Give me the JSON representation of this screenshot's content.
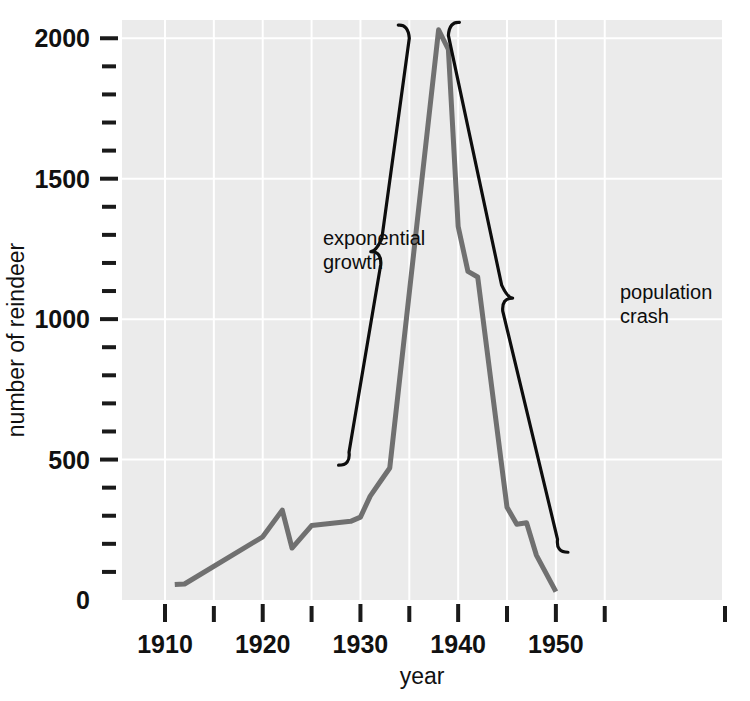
{
  "chart_data": {
    "type": "line",
    "title": "",
    "xlabel": "year",
    "ylabel": "number of reindeer",
    "xlim": [
      1905.6,
      1967.0
    ],
    "ylim": [
      0,
      2065
    ],
    "grid": true,
    "legend": "none",
    "x_ticks_major": [
      1910,
      1920,
      1930,
      1940,
      1950
    ],
    "x_ticks_major_labels": [
      "1910",
      "1920",
      "1930",
      "1940",
      "1950"
    ],
    "x_ticks_minor": [
      1905,
      1915,
      1925,
      1935,
      1945,
      1955
    ],
    "y_ticks_major": [
      0,
      500,
      1000,
      1500,
      2000
    ],
    "y_ticks_major_labels": [
      "0",
      "500",
      "1000",
      "1500",
      "2000"
    ],
    "y_ticks_minor": [
      100,
      200,
      300,
      400,
      600,
      700,
      800,
      900,
      1100,
      1200,
      1300,
      1400,
      1600,
      1700,
      1800,
      1900
    ],
    "series": [
      {
        "name": "reindeer population",
        "color": "#707070",
        "line_width": 5,
        "x": [
          1911,
          1912,
          1920,
          1922,
          1923,
          1925,
          1929,
          1930,
          1931,
          1932,
          1933,
          1938,
          1939,
          1940,
          1941,
          1942,
          1945,
          1946,
          1947,
          1948,
          1950
        ],
        "y": [
          55,
          57,
          225,
          320,
          185,
          265,
          280,
          295,
          370,
          420,
          470,
          2030,
          1960,
          1330,
          1170,
          1150,
          330,
          270,
          275,
          160,
          30
        ]
      }
    ],
    "annotations": [
      {
        "id": "exponential-growth",
        "text_lines": [
          "exponential",
          "growth"
        ],
        "marker": "curly-brace",
        "brace_orientation": "left",
        "brace_x_range": [
          1929,
          1935
        ],
        "brace_y_range": [
          480,
          2050
        ],
        "pointer_value": 1240
      },
      {
        "id": "population-crash",
        "text_lines": [
          "population",
          "crash"
        ],
        "marker": "curly-brace",
        "brace_orientation": "right",
        "brace_x_range": [
          1939,
          1950
        ],
        "brace_y_range": [
          170,
          2060
        ],
        "pointer_value": 1075
      }
    ]
  },
  "colors": {
    "plot_background": "#ebebeb",
    "gridline": "#ffffff",
    "series_line": "#707070",
    "text": "#111111",
    "annotation": "#0d0d0d",
    "page_background": "#ffffff"
  }
}
